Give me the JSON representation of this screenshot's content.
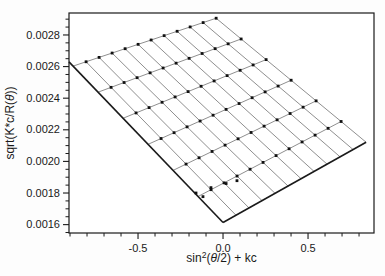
{
  "style": {
    "background": "#fdfdfd",
    "axis_color": "#1a1a1a",
    "grid_line_color": "#8f8f8f",
    "fit_line_color": "#1a1a1a",
    "dot_color": "#111111",
    "tick_label_size": 11,
    "axis_label_size": 12
  },
  "chart_data": {
    "type": "scatter",
    "title": "",
    "subtitle": "Zimm plot: grid of light-scattering points vs angle and concentration with zero-angle and zero-concentration extrapolation lines",
    "xlabel": {
      "pre": "sin",
      "sup": "2",
      "theta_part": "θ",
      "post": "(θ/2) + kc",
      "post_open": "(",
      "post_close": "/2) + kc"
    },
    "ylabel": {
      "pre": "sqrt(K*c/R(",
      "theta": "θ",
      "close": "))"
    },
    "xlim": [
      -0.906,
      0.888
    ],
    "ylim": [
      0.001547,
      0.002939
    ],
    "grid": false,
    "legend": "none",
    "x_ticks": {
      "major": [
        -0.5,
        0.0,
        0.5
      ],
      "major_labels": [
        "-0.5",
        "0.0",
        "0.5"
      ],
      "minor_start": -0.9,
      "minor_end": 0.8,
      "minor_step": 0.1
    },
    "y_ticks": {
      "major": [
        0.0016,
        0.0018,
        0.002,
        0.0022,
        0.0024,
        0.0026,
        0.0028
      ],
      "major_labels": [
        "0.0016",
        "0.0018",
        "0.0020",
        "0.0022",
        "0.0024",
        "0.0026",
        "0.0028"
      ],
      "minor_start": 0.00155,
      "minor_end": 0.0029,
      "minor_step": 5e-05
    },
    "zimm_model": {
      "y_intercept_at_origin": 0.001613,
      "angle_axis_values_s": [
        0.0765,
        0.153,
        0.2295,
        0.306,
        0.3825,
        0.459,
        0.5355,
        0.612,
        0.6885,
        0.765,
        0.8415
      ],
      "zero_concentration_row": {
        "kc": 0.0,
        "y_int": 0.001613,
        "slope": 0.000604
      },
      "concentration_rows": [
        {
          "kc": -0.147,
          "y_int": 0.001778,
          "slope": 0.000564
        },
        {
          "kc": -0.294,
          "y_int": 0.001943,
          "slope": 0.000523
        },
        {
          "kc": -0.441,
          "y_int": 0.002108,
          "slope": 0.000482
        },
        {
          "kc": -0.588,
          "y_int": 0.002273,
          "slope": 0.000441
        },
        {
          "kc": -0.735,
          "y_int": 0.002438,
          "slope": 0.0004
        },
        {
          "kc": -0.882,
          "y_int": 0.002603,
          "slope": 0.00036
        }
      ],
      "zero_angle_line": {
        "x_start": 0.0,
        "y_start": 0.001613,
        "x_end": -0.906,
        "y_end": 0.00263
      },
      "zero_conc_line": {
        "x_start": 0.0,
        "y_start": 0.001613,
        "x_end": 0.8415,
        "y_end": 0.002121
      }
    },
    "extrapolated_points": [
      {
        "x": -0.159,
        "y": 0.0018
      },
      {
        "x": -0.118,
        "y": 0.001777
      },
      {
        "x": -0.071,
        "y": 0.001834
      },
      {
        "x": 0.018,
        "y": 0.00186
      },
      {
        "x": 0.082,
        "y": 0.001878
      }
    ]
  }
}
